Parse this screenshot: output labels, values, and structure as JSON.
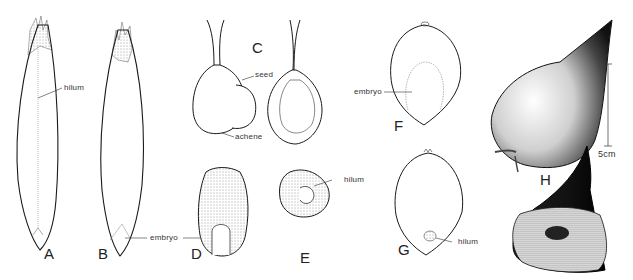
{
  "figure": {
    "panels": [
      {
        "id": "A",
        "label": "A",
        "callouts": [
          "hilum"
        ]
      },
      {
        "id": "B",
        "label": "B",
        "callouts": [
          "embryo"
        ]
      },
      {
        "id": "C",
        "label": "C",
        "callouts": [
          "seed",
          "achene"
        ]
      },
      {
        "id": "D",
        "label": "D",
        "callouts": []
      },
      {
        "id": "E",
        "label": "E",
        "callouts": [
          "hilum"
        ]
      },
      {
        "id": "F",
        "label": "F",
        "callouts": [
          "embryo"
        ]
      },
      {
        "id": "G",
        "label": "G",
        "callouts": [
          "hilum"
        ]
      },
      {
        "id": "H",
        "label": "H",
        "callouts": []
      }
    ],
    "callouts": {
      "a_hilum": "hilum",
      "bd_embryo": "embryo",
      "c_seed": "seed",
      "c_achene": "achene",
      "e_hilum": "hilum",
      "f_embryo": "embryo",
      "g_hilum": "hilum"
    },
    "scale_bar": {
      "label": "5cm"
    },
    "colors": {
      "ink": "#1a1a1a",
      "stipple": "#555555",
      "background": "#ffffff"
    }
  }
}
